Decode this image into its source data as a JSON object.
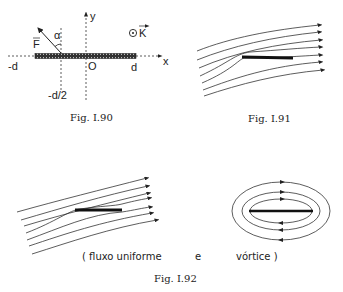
{
  "fig90": {
    "caption": "Fig. I.90",
    "labels": {
      "force": "F",
      "angle": "α",
      "y_axis": "y",
      "x_axis": "x",
      "origin": "O",
      "minus_d": "-d",
      "plus_d": "d",
      "minus_half_d": "-d/2",
      "k_vector": "K",
      "k_symbol": "⊙"
    }
  },
  "fig91": {
    "caption": "Fig. I.91"
  },
  "fig92": {
    "caption": "Fig. I.92",
    "text_left": "( fluxo uniforme",
    "text_mid": "e",
    "text_right": "vórtice )"
  }
}
